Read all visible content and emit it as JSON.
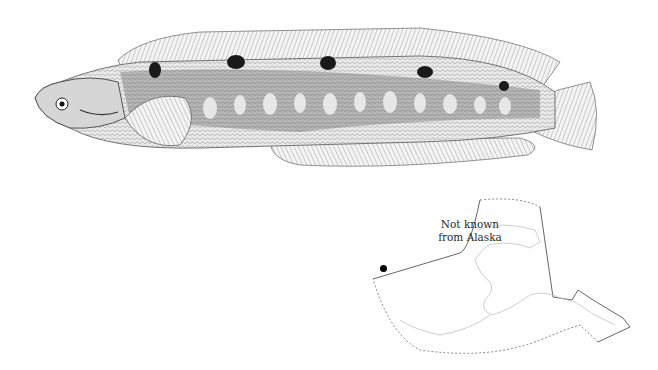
{
  "figure": {
    "illustration": "fish-illustration",
    "map": {
      "label_line1": "Not known",
      "label_line2": "from Alaska",
      "region": "Alaska",
      "occurrence_marker": "dot"
    }
  },
  "colors": {
    "ink": "#1a1a1a",
    "background": "#ffffff",
    "map_line": "#555555",
    "coast_line": "#bbbbbb"
  }
}
